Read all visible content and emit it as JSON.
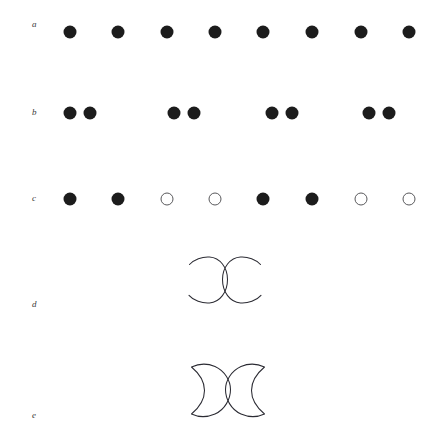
{
  "figure": {
    "width": 433,
    "height": 437,
    "background_color": "#ffffff",
    "stroke_color": "#2b2b33",
    "filled_marker_color": "#1c1c1c",
    "open_marker_stroke_color": "#59595c",
    "label_color": "#3a3a3a"
  },
  "rows": [
    {
      "id": "row-a",
      "label": "a",
      "label_x": 32,
      "label_y": 26,
      "type": "markers",
      "center_y": 32,
      "marker_diameter": 13,
      "markers": [
        {
          "x": 70,
          "state": "filled"
        },
        {
          "x": 118,
          "state": "filled"
        },
        {
          "x": 167,
          "state": "filled"
        },
        {
          "x": 215,
          "state": "filled"
        },
        {
          "x": 263,
          "state": "filled"
        },
        {
          "x": 312,
          "state": "filled"
        },
        {
          "x": 361,
          "state": "filled"
        },
        {
          "x": 409,
          "state": "filled"
        }
      ]
    },
    {
      "id": "row-b",
      "label": "b",
      "label_x": 32,
      "label_y": 112,
      "type": "markers",
      "center_y": 113,
      "marker_diameter": 13,
      "markers": [
        {
          "x": 70,
          "state": "filled"
        },
        {
          "x": 90,
          "state": "filled"
        },
        {
          "x": 174,
          "state": "filled"
        },
        {
          "x": 194,
          "state": "filled"
        },
        {
          "x": 272,
          "state": "filled"
        },
        {
          "x": 292,
          "state": "filled"
        },
        {
          "x": 369,
          "state": "filled"
        },
        {
          "x": 389,
          "state": "filled"
        }
      ]
    },
    {
      "id": "row-c",
      "label": "c",
      "label_x": 32,
      "label_y": 198,
      "type": "markers",
      "center_y": 199,
      "marker_diameter": 13,
      "markers": [
        {
          "x": 70,
          "state": "filled"
        },
        {
          "x": 118,
          "state": "filled"
        },
        {
          "x": 167,
          "state": "open"
        },
        {
          "x": 215,
          "state": "open"
        },
        {
          "x": 263,
          "state": "filled"
        },
        {
          "x": 312,
          "state": "filled"
        },
        {
          "x": 361,
          "state": "open"
        },
        {
          "x": 409,
          "state": "open"
        }
      ]
    },
    {
      "id": "row-d",
      "label": "d",
      "label_x": 32,
      "label_y": 305,
      "type": "curves",
      "shape_name": "mirrored-open-arcs",
      "shape_x": 180,
      "shape_y": 250,
      "shape_width": 84,
      "shape_height": 72
    },
    {
      "id": "row-e",
      "label": "e",
      "label_x": 32,
      "label_y": 415,
      "type": "curves",
      "shape_name": "mirrored-crescents",
      "shape_x": 183,
      "shape_y": 358,
      "shape_width": 84,
      "shape_height": 70
    }
  ]
}
